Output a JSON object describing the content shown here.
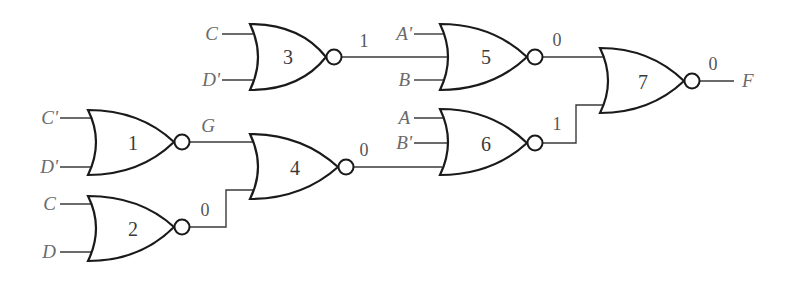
{
  "diagram": {
    "type": "logic-circuit",
    "gate_type": "NOR",
    "gates": [
      {
        "id": "1",
        "label": "1",
        "inputs": [
          "C'",
          "D'"
        ],
        "output_label": "G"
      },
      {
        "id": "2",
        "label": "2",
        "inputs": [
          "C",
          "D"
        ],
        "output_value": "0"
      },
      {
        "id": "3",
        "label": "3",
        "inputs": [
          "C",
          "D'"
        ],
        "output_value": "1"
      },
      {
        "id": "4",
        "label": "4",
        "inputs": [
          "G",
          "0"
        ],
        "output_value": "0"
      },
      {
        "id": "5",
        "label": "5",
        "inputs": [
          "A'",
          "1",
          "B"
        ],
        "output_value": "0"
      },
      {
        "id": "6",
        "label": "6",
        "inputs": [
          "A",
          "B'",
          "0"
        ],
        "output_value": "1"
      },
      {
        "id": "7",
        "label": "7",
        "inputs": [
          "0",
          "1"
        ],
        "output_value": "0"
      }
    ],
    "input_labels": {
      "g3_in1": "C",
      "g3_in2": "D'",
      "g5_in1": "A'",
      "g5_in3": "B",
      "g1_in1": "C'",
      "g1_in2": "D'",
      "g2_in1": "C",
      "g2_in2": "D",
      "g6_in1": "A",
      "g6_in2": "B'"
    },
    "wire_values": {
      "g3_out": "1",
      "g5_out": "0",
      "g7_out": "0",
      "g1_out": "G",
      "g4_out": "0",
      "g6_out": "1",
      "g2_out": "0"
    },
    "output_label": "F"
  }
}
